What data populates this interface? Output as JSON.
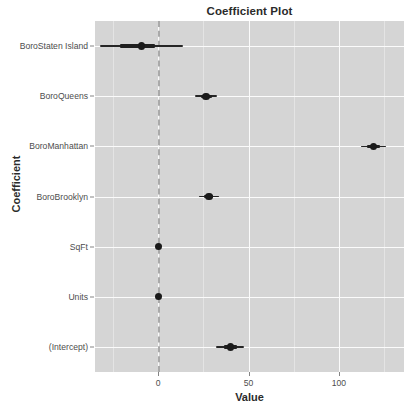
{
  "chart_data": {
    "type": "scatter",
    "title": "Coefficient Plot",
    "xlabel": "Value",
    "ylabel": "Coefficient",
    "xlim": [
      -35,
      136
    ],
    "xticks": [
      0,
      50,
      100
    ],
    "xtick_labels": [
      "0",
      "50",
      "100"
    ],
    "grid": true,
    "legend": null,
    "zero_reference_line": 0,
    "orientation": "horizontal",
    "categories": [
      "BoroStaten Island",
      "BoroQueens",
      "BoroManhattan",
      "BoroBrooklyn",
      "SqFt",
      "Units",
      "(Intercept)"
    ],
    "values": [
      -9.4,
      26.5,
      119.0,
      28.0,
      0.0,
      0.0,
      40.0
    ],
    "points": [
      {
        "label": "BoroStaten Island",
        "estimate": -9.4,
        "inner_low": -21.0,
        "inner_high": -2.0,
        "outer_low": -32.5,
        "outer_high": 13.8
      },
      {
        "label": "BoroQueens",
        "estimate": 26.5,
        "inner_low": 23.5,
        "inner_high": 29.5,
        "outer_low": 20.5,
        "outer_high": 32.5
      },
      {
        "label": "BoroManhattan",
        "estimate": 119.0,
        "inner_low": 115.5,
        "inner_high": 122.5,
        "outer_low": 112.0,
        "outer_high": 126.0
      },
      {
        "label": "BoroBrooklyn",
        "estimate": 28.0,
        "inner_low": 25.5,
        "inner_high": 30.5,
        "outer_low": 22.5,
        "outer_high": 33.5
      },
      {
        "label": "SqFt",
        "estimate": 0.0,
        "inner_low": 0.0,
        "inner_high": 0.0,
        "outer_low": 0.0,
        "outer_high": 0.0
      },
      {
        "label": "Units",
        "estimate": 0.0,
        "inner_low": 0.0,
        "inner_high": 0.0,
        "outer_low": 0.0,
        "outer_high": 0.0
      },
      {
        "label": "(Intercept)",
        "estimate": 40.0,
        "inner_low": 36.5,
        "inner_high": 43.5,
        "outer_low": 32.0,
        "outer_high": 47.5
      }
    ],
    "colors": {
      "panel_background": "#d5d5d5",
      "major_grid": "#fbfbfb",
      "minor_grid": "#e4e4e4",
      "point": "#1a1a1a",
      "zero_line": "#a9a9a9",
      "text": "#4d4d4d",
      "title": "#2b2b2b"
    }
  }
}
